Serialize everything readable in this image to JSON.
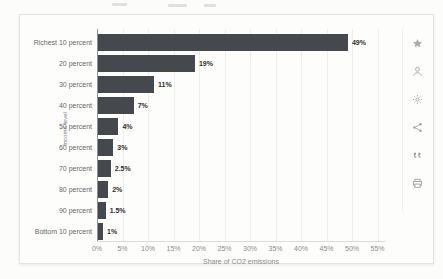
{
  "page": {
    "background": "#fcfcfa"
  },
  "chart_data": {
    "type": "bar",
    "orientation": "horizontal",
    "categories": [
      "Richest 10 percent",
      "20 percent",
      "30 percent",
      "40 percent",
      "50 percent",
      "60 percent",
      "70 percent",
      "80 percent",
      "90 percent",
      "Bottom 10 percent"
    ],
    "values": [
      49,
      19,
      11,
      7,
      4,
      3,
      2.5,
      2,
      1.5,
      1
    ],
    "value_labels": [
      "49%",
      "19%",
      "11%",
      "7%",
      "4%",
      "3%",
      "2.5%",
      "2%",
      "1.5%",
      "1%"
    ],
    "xlabel": "Share of CO2 emissions",
    "ylabel": "Income level",
    "x_ticks": [
      "0%",
      "5%",
      "10%",
      "15%",
      "20%",
      "25%",
      "30%",
      "35%",
      "40%",
      "45%",
      "50%",
      "55%"
    ],
    "xlim": [
      0,
      55
    ],
    "grid": true,
    "legend": false,
    "bar_color": "#45494e",
    "gridline_color": "#ededea",
    "value_label_color": "#2e2e2e",
    "category_label_color": "#67676a",
    "tick_label_color": "#8b8b8b"
  },
  "toolbar": {
    "icons": [
      {
        "name": "favorite-star-icon"
      },
      {
        "name": "user-icon"
      },
      {
        "name": "settings-gear-icon"
      },
      {
        "name": "share-icon"
      },
      {
        "name": "quote-icon"
      },
      {
        "name": "print-icon"
      }
    ]
  }
}
